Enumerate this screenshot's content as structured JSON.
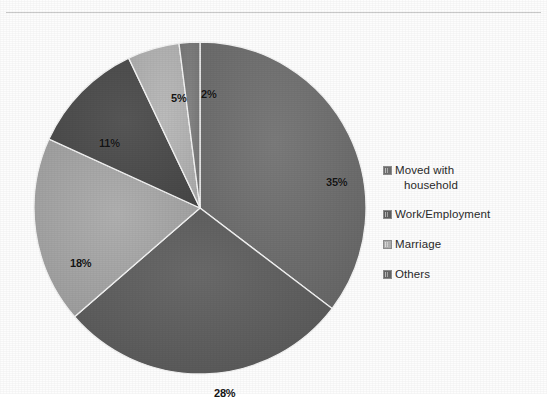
{
  "chart_data": {
    "type": "pie",
    "title": "",
    "subtitle": "",
    "xlabel": "",
    "ylabel": "",
    "grid": false,
    "legend_position": "right",
    "start_angle_deg": 0,
    "direction": "clockwise",
    "categories": [
      "Moved with household",
      "Work/Employment",
      "Marriage",
      "Others",
      "Slice 5",
      "Slice 6"
    ],
    "values": [
      35,
      28,
      18,
      11,
      5,
      2
    ],
    "labels": [
      "35%",
      "28%",
      "18%",
      "11%",
      "5%",
      "2%"
    ],
    "colors": [
      "#6f6f6f",
      "#5f5f5f",
      "#a5a5a5",
      "#4d4d4d",
      "#b2b2b2",
      "#7b7b7b"
    ],
    "slices": [
      {
        "label": "35%",
        "value": 35,
        "color": "#6f6f6f",
        "label_x": 298,
        "label_y": 140
      },
      {
        "label": "28%",
        "value": 28,
        "color": "#5f5f5f",
        "label_x": 186,
        "label_y": 351
      },
      {
        "label": "18%",
        "value": 18,
        "color": "#a5a5a5",
        "label_x": 42,
        "label_y": 221
      },
      {
        "label": "11%",
        "value": 11,
        "color": "#4d4d4d",
        "label_x": 71,
        "label_y": 101
      },
      {
        "label": "5%",
        "value": 5,
        "color": "#b2b2b2",
        "label_x": 143,
        "label_y": 56
      },
      {
        "label": "2%",
        "value": 2,
        "color": "#7b7b7b",
        "label_x": 173,
        "label_y": 52
      }
    ]
  },
  "legend": {
    "items": [
      {
        "label": "Moved with",
        "label_line2": "household",
        "swatch": "#6f6f6f"
      },
      {
        "label": "Work/Employment",
        "label_line2": "",
        "swatch": "#5f5f5f"
      },
      {
        "label": "Marriage",
        "label_line2": "",
        "swatch": "#b0b0b0"
      },
      {
        "label": "Others",
        "label_line2": "",
        "swatch": "#666666"
      }
    ]
  },
  "pie_geometry": {
    "center_x": 172,
    "center_y": 172,
    "radius": 166
  }
}
